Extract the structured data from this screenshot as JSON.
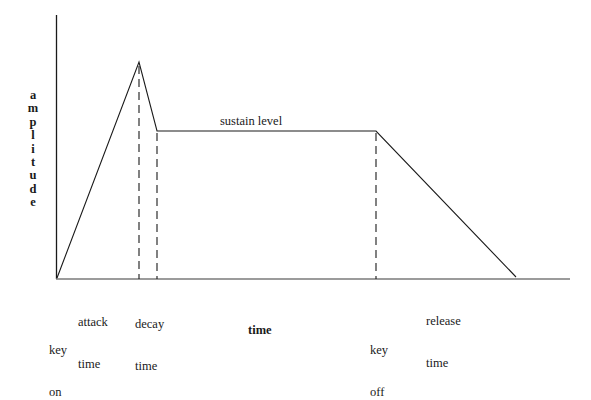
{
  "diagram": {
    "type": "ADSR envelope",
    "y_axis_label": "amplitude",
    "y_axis_letters": [
      "a",
      "m",
      "p",
      "l",
      "i",
      "t",
      "u",
      "d",
      "e"
    ],
    "x_axis_label": "time",
    "labels": {
      "sustain_level": "sustain level",
      "attack_time_line1": "attack",
      "attack_time_line2": "time",
      "decay_time_line1": "decay",
      "decay_time_line2": "time",
      "release_time_line1": "release",
      "release_time_line2": "time",
      "key_on_line1": "key",
      "key_on_line2": "on",
      "key_off_line1": "key",
      "key_off_line2": "off"
    },
    "envelope_points": [
      {
        "name": "start",
        "x": 56,
        "y": 279
      },
      {
        "name": "attack_peak",
        "x": 139,
        "y": 62
      },
      {
        "name": "decay_end",
        "x": 157,
        "y": 131
      },
      {
        "name": "sustain_end",
        "x": 376,
        "y": 131
      },
      {
        "name": "release_end",
        "x": 516,
        "y": 277
      }
    ],
    "colors": {
      "line": "#1a1a1a",
      "x_axis": "#7a7a7a",
      "background": "#ffffff"
    }
  }
}
